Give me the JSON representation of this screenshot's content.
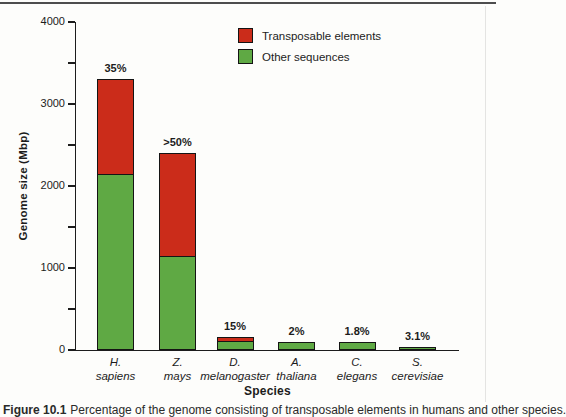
{
  "figure": {
    "caption": {
      "prefix": "Figure 10.1",
      "text": "Percentage of the genome consisting of transposable elements in humans and other species."
    }
  },
  "chart_data": {
    "type": "bar",
    "stacked": true,
    "title": "",
    "xlabel": "Species",
    "ylabel": "Genome size (Mbp)",
    "ylim": [
      0,
      4000
    ],
    "ytick_major_interval": 1000,
    "ytick_minor_interval": 500,
    "ytick_labels": [
      "0",
      "1000",
      "2000",
      "3000",
      "4000"
    ],
    "grid": false,
    "legend_position": "top-right",
    "legend": [
      {
        "label": "Transposable elements",
        "color": "#cb2c1a"
      },
      {
        "label": "Other sequences",
        "color": "#5fa944"
      }
    ],
    "categories": [
      {
        "abbr": "H.",
        "species": "sapiens"
      },
      {
        "abbr": "Z.",
        "species": "mays"
      },
      {
        "abbr": "D.",
        "species": "melanogaster"
      },
      {
        "abbr": "A.",
        "species": "thaliana"
      },
      {
        "abbr": "C.",
        "species": "elegans"
      },
      {
        "abbr": "S.",
        "species": "cerevisiae"
      }
    ],
    "series": [
      {
        "name": "Other sequences",
        "color": "#5fa944",
        "values_mbp": [
          2145,
          1150,
          115,
          90,
          92,
          36
        ]
      },
      {
        "name": "Transposable elements",
        "color": "#cb2c1a",
        "values_mbp": [
          1155,
          1250,
          45,
          5,
          3,
          2
        ]
      }
    ],
    "totals_mbp": [
      3300,
      2400,
      160,
      95,
      95,
      38
    ],
    "bar_labels": [
      "35%",
      ">50%",
      "15%",
      "2%",
      "1.8%",
      "3.1%"
    ],
    "outline_color": "#141414"
  }
}
